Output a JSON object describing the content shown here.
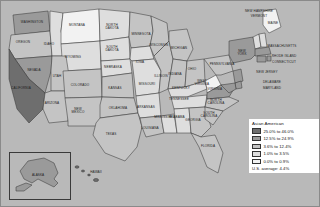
{
  "map": {
    "kind": "choropleth-map",
    "region": "United States",
    "background_color": "#b9b9b9",
    "states": [
      {
        "name": "WASHINGTON",
        "class": "c4",
        "x": 31,
        "y": 22
      },
      {
        "name": "OREGON",
        "class": "c3",
        "x": 22,
        "y": 42
      },
      {
        "name": "IDAHO",
        "class": "c2",
        "x": 48,
        "y": 44
      },
      {
        "name": "MONTANA",
        "class": "c1",
        "x": 76,
        "y": 25
      },
      {
        "name": "WYOMING",
        "class": "c2",
        "x": 72,
        "y": 57
      },
      {
        "name": "NEVADA",
        "class": "c4",
        "x": 33,
        "y": 70
      },
      {
        "name": "UTAH",
        "class": "c3",
        "x": 56,
        "y": 76
      },
      {
        "name": "CALIFORNIA",
        "class": "c5",
        "x": 20,
        "y": 88
      },
      {
        "name": "ARIZONA",
        "class": "c3",
        "x": 51,
        "y": 103
      },
      {
        "name": "COLORADO",
        "class": "c3",
        "x": 79,
        "y": 85
      },
      {
        "name": "NEW\nMEXICO",
        "class": "c3",
        "x": 77,
        "y": 110
      },
      {
        "name": "NORTH\nDAKOTA",
        "class": "c2",
        "x": 111,
        "y": 26
      },
      {
        "name": "SOUTH\nDAKOTA",
        "class": "c2",
        "x": 111,
        "y": 48
      },
      {
        "name": "NEBRASKA",
        "class": "c2",
        "x": 112,
        "y": 67
      },
      {
        "name": "KANSAS",
        "class": "c3",
        "x": 114,
        "y": 88
      },
      {
        "name": "OKLAHOMA",
        "class": "c3",
        "x": 117,
        "y": 108
      },
      {
        "name": "TEXAS",
        "class": "c3",
        "x": 110,
        "y": 134
      },
      {
        "name": "MINNESOTA",
        "class": "c3",
        "x": 140,
        "y": 34
      },
      {
        "name": "IOWA",
        "class": "c2",
        "x": 139,
        "y": 62
      },
      {
        "name": "MISSOURI",
        "class": "c2",
        "x": 146,
        "y": 84
      },
      {
        "name": "ARKANSAS",
        "class": "c2",
        "x": 145,
        "y": 107
      },
      {
        "name": "LOUISIANA",
        "class": "c3",
        "x": 149,
        "y": 128
      },
      {
        "name": "WISCONSIN",
        "class": "c3",
        "x": 158,
        "y": 45
      },
      {
        "name": "ILLINOIS",
        "class": "c3",
        "x": 160,
        "y": 76
      },
      {
        "name": "MISSISSIPPI",
        "class": "c2",
        "x": 163,
        "y": 117
      },
      {
        "name": "MICHIGAN",
        "class": "c3",
        "x": 178,
        "y": 48
      },
      {
        "name": "INDIANA",
        "class": "c3",
        "x": 174,
        "y": 74
      },
      {
        "name": "KENTUCKY",
        "class": "c2",
        "x": 180,
        "y": 88
      },
      {
        "name": "TENNESSEE",
        "class": "c2",
        "x": 178,
        "y": 99
      },
      {
        "name": "ALABAMA",
        "class": "c2",
        "x": 176,
        "y": 117
      },
      {
        "name": "OHIO",
        "class": "c3",
        "x": 191,
        "y": 69
      },
      {
        "name": "GEORGIA",
        "class": "c3",
        "x": 192,
        "y": 120
      },
      {
        "name": "FLORIDA",
        "class": "c3",
        "x": 207,
        "y": 146
      },
      {
        "name": "WEST\nVIRGINIA",
        "class": "c1",
        "x": 201,
        "y": 82
      },
      {
        "name": "VIRGINIA",
        "class": "c4",
        "x": 214,
        "y": 89
      },
      {
        "name": "NORTH\nCAROLINA",
        "class": "c3",
        "x": 215,
        "y": 101
      },
      {
        "name": "SOUTH\nCAROLINA",
        "class": "c3",
        "x": 208,
        "y": 114
      },
      {
        "name": "PENNSYLVANIA",
        "class": "c3",
        "x": 221,
        "y": 64
      },
      {
        "name": "NEW\nYORK",
        "class": "c4",
        "x": 241,
        "y": 52
      },
      {
        "name": "MAINE",
        "class": "c1",
        "x": 272,
        "y": 23
      },
      {
        "name": "NEW HAMPSHIRE",
        "class": "c2",
        "x": 258,
        "y": 11
      },
      {
        "name": "VERMONT",
        "class": "c2",
        "x": 258,
        "y": 16
      },
      {
        "name": "MASSACHUSETTS",
        "class": "c4",
        "x": 281,
        "y": 46
      },
      {
        "name": "RHODE ISLAND",
        "class": "c4",
        "x": 283,
        "y": 56
      },
      {
        "name": "CONNECTICUT",
        "class": "c4",
        "x": 283,
        "y": 62
      },
      {
        "name": "NEW JERSEY",
        "class": "c4",
        "x": 266,
        "y": 72
      },
      {
        "name": "DELAWARE",
        "class": "c4",
        "x": 271,
        "y": 82
      },
      {
        "name": "MARYLAND",
        "class": "c4",
        "x": 271,
        "y": 88
      }
    ],
    "inset": {
      "alaska_label": "ALASKA",
      "hawaii_label": "HAWAII"
    }
  },
  "legend": {
    "title": "Asian American",
    "items": [
      {
        "label": "25.0% to 46.0%",
        "color": "#6e6e6e"
      },
      {
        "label": "12.5% to 24.9%",
        "color": "#9a9a9a"
      },
      {
        "label": "3.6% to 12.4%",
        "color": "#c4c4c4"
      },
      {
        "label": "1.0% to 3.5%",
        "color": "#dedede"
      },
      {
        "label": "0.0% to 0.9%",
        "color": "#f2f2f2"
      }
    ],
    "average": "U.S. average:  4.4%"
  }
}
